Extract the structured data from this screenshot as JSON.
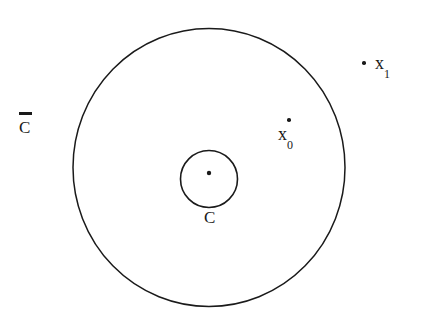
{
  "figure": {
    "background_color": "#ffffff",
    "stroke_color": "#1a1a1a",
    "width": 430,
    "height": 328,
    "outer_circle": {
      "name": "C-bar",
      "label": "C",
      "has_overbar": true,
      "center_x": 209,
      "center_y": 167,
      "radius_x": 136,
      "radius_y": 139,
      "stroke_width": 1.5,
      "fill": "none"
    },
    "inner_circle": {
      "name": "C",
      "label": "C",
      "has_overbar": false,
      "center_x": 209,
      "center_y": 179,
      "radius_x": 28.5,
      "radius_y": 28.5,
      "stroke_width": 1.5,
      "fill": "none"
    },
    "center_dot": {
      "name": "inner-circle-center",
      "x": 209,
      "y": 173,
      "radius": 2.2
    },
    "points": [
      {
        "id": "x0",
        "base": "x",
        "subscript": "0",
        "dot_x": 288,
        "dot_y": 120,
        "label_position": "below",
        "inside_outer_circle": true
      },
      {
        "id": "x1",
        "base": "x",
        "subscript": "1",
        "dot_x": 364,
        "dot_y": 62,
        "label_position": "right",
        "inside_outer_circle": false
      }
    ],
    "labels": {
      "outer_label": "C",
      "outer_overbar_char": "̄",
      "inner_label": "C",
      "x0_base": "x",
      "x0_sub": "0",
      "x1_base": "x",
      "x1_sub": "1"
    }
  }
}
